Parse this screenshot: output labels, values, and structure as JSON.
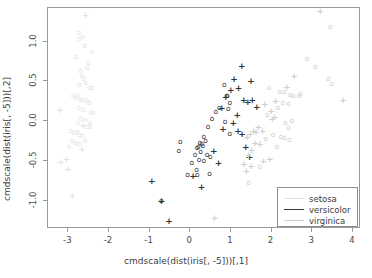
{
  "chart_data": {
    "type": "scatter",
    "title": "",
    "xlabel": "cmdscale(dist(iris[, -5]))[,1]",
    "ylabel": "cmdscale(dist(iris[, -5]))[,2]",
    "xlim": [
      -3.5,
      4.2
    ],
    "ylim": [
      -1.35,
      1.42
    ],
    "xticks": [
      -3,
      -2,
      -1,
      0,
      1,
      2,
      3,
      4
    ],
    "xticklabels": [
      "-3",
      "-2",
      "-1",
      "0",
      "1",
      "2",
      "3",
      "4"
    ],
    "yticks": [
      -1.0,
      -0.5,
      0.0,
      0.5,
      1.0
    ],
    "yticklabels": [
      "-1.0",
      "-0.5",
      "0.0",
      "0.5",
      "1.0"
    ],
    "grid": false,
    "legend_position": "bottom-right",
    "legend": [
      {
        "label": "setosa",
        "color": "#e2e2e2"
      },
      {
        "label": "versicolor",
        "color": "#3a3a3a"
      },
      {
        "label": "virginica",
        "color": "#cdcdcd"
      }
    ],
    "series": [
      {
        "name": "setosa",
        "color": "#e4e4e4",
        "points": [
          {
            "x": -2.55,
            "y": 1.32,
            "m": "+"
          },
          {
            "x": -2.72,
            "y": 1.1,
            "m": "o"
          },
          {
            "x": -2.7,
            "y": 1.02,
            "m": "o"
          },
          {
            "x": -2.62,
            "y": 1.05,
            "m": "o"
          },
          {
            "x": -2.57,
            "y": 0.93,
            "m": "o"
          },
          {
            "x": -2.78,
            "y": 0.79,
            "m": "o"
          },
          {
            "x": -2.4,
            "y": 0.86,
            "m": "o"
          },
          {
            "x": -2.48,
            "y": 0.72,
            "m": "o"
          },
          {
            "x": -2.68,
            "y": 0.62,
            "m": "o"
          },
          {
            "x": -2.64,
            "y": 0.56,
            "m": "o"
          },
          {
            "x": -2.6,
            "y": 0.52,
            "m": "o"
          },
          {
            "x": -2.55,
            "y": 0.47,
            "m": "o"
          },
          {
            "x": -2.7,
            "y": 0.44,
            "m": "o"
          },
          {
            "x": -2.46,
            "y": 0.4,
            "m": "o"
          },
          {
            "x": -2.39,
            "y": 0.4,
            "m": "o"
          },
          {
            "x": -2.86,
            "y": 0.3,
            "m": "o"
          },
          {
            "x": -2.8,
            "y": 0.28,
            "m": "o"
          },
          {
            "x": -2.74,
            "y": 0.31,
            "m": "o"
          },
          {
            "x": -2.69,
            "y": 0.26,
            "m": "o"
          },
          {
            "x": -2.62,
            "y": 0.25,
            "m": "o"
          },
          {
            "x": -2.52,
            "y": 0.24,
            "m": "o"
          },
          {
            "x": -2.46,
            "y": 0.22,
            "m": "o"
          },
          {
            "x": -3.18,
            "y": 0.13,
            "m": "+"
          },
          {
            "x": -2.72,
            "y": 0.16,
            "m": "o"
          },
          {
            "x": -2.6,
            "y": 0.13,
            "m": "o"
          },
          {
            "x": -2.42,
            "y": 0.1,
            "m": "o"
          },
          {
            "x": -2.36,
            "y": 0.09,
            "m": "o"
          },
          {
            "x": -2.66,
            "y": 0.02,
            "m": "o"
          },
          {
            "x": -2.56,
            "y": 0.0,
            "m": "o"
          },
          {
            "x": -2.74,
            "y": -0.04,
            "m": "o"
          },
          {
            "x": -2.62,
            "y": -0.06,
            "m": "+"
          },
          {
            "x": -2.52,
            "y": -0.09,
            "m": "o"
          },
          {
            "x": -2.44,
            "y": -0.09,
            "m": "o"
          },
          {
            "x": -2.92,
            "y": -0.13,
            "m": "o"
          },
          {
            "x": -2.84,
            "y": -0.16,
            "m": "o"
          },
          {
            "x": -2.76,
            "y": -0.15,
            "m": "o"
          },
          {
            "x": -2.7,
            "y": -0.18,
            "m": "o"
          },
          {
            "x": -2.62,
            "y": -0.2,
            "m": "o"
          },
          {
            "x": -2.88,
            "y": -0.26,
            "m": "o"
          },
          {
            "x": -2.8,
            "y": -0.28,
            "m": "o"
          },
          {
            "x": -2.72,
            "y": -0.3,
            "m": "o"
          },
          {
            "x": -2.56,
            "y": -0.26,
            "m": "o"
          },
          {
            "x": -2.96,
            "y": -0.34,
            "m": "o"
          },
          {
            "x": -2.64,
            "y": -0.36,
            "m": "+"
          },
          {
            "x": -3.02,
            "y": -0.49,
            "m": "+"
          },
          {
            "x": -3.16,
            "y": -0.52,
            "m": "+"
          },
          {
            "x": -2.98,
            "y": -0.61,
            "m": "+"
          },
          {
            "x": -2.88,
            "y": -0.95,
            "m": "+"
          },
          {
            "x": -2.5,
            "y": 0.66,
            "m": "o"
          },
          {
            "x": -2.44,
            "y": -0.04,
            "m": "o"
          }
        ]
      },
      {
        "name": "versicolor",
        "color": "#333333",
        "points": [
          {
            "x": 1.29,
            "y": 0.68,
            "m": "+"
          },
          {
            "x": 1.1,
            "y": 0.52,
            "m": "+"
          },
          {
            "x": 1.52,
            "y": 0.49,
            "m": "+"
          },
          {
            "x": 0.86,
            "y": 0.44,
            "m": "o"
          },
          {
            "x": 1.21,
            "y": 0.4,
            "m": "+"
          },
          {
            "x": 1.02,
            "y": 0.38,
            "m": "+"
          },
          {
            "x": 0.92,
            "y": 0.3,
            "m": "o"
          },
          {
            "x": 0.94,
            "y": 0.31,
            "m": "o"
          },
          {
            "x": 0.9,
            "y": 0.29,
            "m": "+"
          },
          {
            "x": 1.34,
            "y": 0.25,
            "m": "+"
          },
          {
            "x": 1.55,
            "y": 0.26,
            "m": "+"
          },
          {
            "x": 1.0,
            "y": 0.22,
            "m": "o"
          },
          {
            "x": 1.44,
            "y": 0.23,
            "m": "+"
          },
          {
            "x": 0.74,
            "y": 0.16,
            "m": "o"
          },
          {
            "x": 0.8,
            "y": 0.15,
            "m": "+"
          },
          {
            "x": 0.96,
            "y": 0.14,
            "m": "o"
          },
          {
            "x": 1.66,
            "y": 0.17,
            "m": "+"
          },
          {
            "x": 0.65,
            "y": 0.11,
            "m": "o"
          },
          {
            "x": 1.18,
            "y": 0.07,
            "m": "+"
          },
          {
            "x": 0.56,
            "y": 0.02,
            "m": "o"
          },
          {
            "x": 0.88,
            "y": -0.02,
            "m": "o"
          },
          {
            "x": 1.08,
            "y": -0.03,
            "m": "+"
          },
          {
            "x": 0.46,
            "y": -0.08,
            "m": "o"
          },
          {
            "x": 0.83,
            "y": -0.11,
            "m": "+"
          },
          {
            "x": 1.2,
            "y": -0.14,
            "m": "+"
          },
          {
            "x": 1.0,
            "y": -0.17,
            "m": "o"
          },
          {
            "x": 1.3,
            "y": -0.17,
            "m": "+"
          },
          {
            "x": 0.36,
            "y": -0.21,
            "m": "o"
          },
          {
            "x": 0.4,
            "y": -0.26,
            "m": "o"
          },
          {
            "x": -0.22,
            "y": -0.27,
            "m": "o"
          },
          {
            "x": 0.26,
            "y": -0.28,
            "m": "o"
          },
          {
            "x": 0.3,
            "y": -0.3,
            "m": "o"
          },
          {
            "x": 0.33,
            "y": -0.32,
            "m": "o"
          },
          {
            "x": 0.22,
            "y": -0.33,
            "m": "o"
          },
          {
            "x": 1.39,
            "y": -0.34,
            "m": "+"
          },
          {
            "x": 0.19,
            "y": -0.35,
            "m": "o"
          },
          {
            "x": -0.26,
            "y": -0.38,
            "m": "o"
          },
          {
            "x": 0.28,
            "y": -0.4,
            "m": "o"
          },
          {
            "x": 0.6,
            "y": -0.38,
            "m": "+"
          },
          {
            "x": 0.14,
            "y": -0.43,
            "m": "o"
          },
          {
            "x": 0.44,
            "y": -0.44,
            "m": "o"
          },
          {
            "x": 0.52,
            "y": -0.46,
            "m": "o"
          },
          {
            "x": 1.48,
            "y": -0.46,
            "m": "+"
          },
          {
            "x": 0.24,
            "y": -0.5,
            "m": "o"
          },
          {
            "x": 0.36,
            "y": -0.51,
            "m": "o"
          },
          {
            "x": 0.06,
            "y": -0.53,
            "m": "o"
          },
          {
            "x": 0.72,
            "y": -0.54,
            "m": "+"
          },
          {
            "x": 0.18,
            "y": -0.62,
            "m": "o"
          },
          {
            "x": -0.04,
            "y": -0.68,
            "m": "o"
          },
          {
            "x": 0.09,
            "y": -0.7,
            "m": "+"
          },
          {
            "x": 0.2,
            "y": -0.69,
            "m": "o"
          },
          {
            "x": 0.5,
            "y": -0.67,
            "m": "o"
          },
          {
            "x": -0.92,
            "y": -0.76,
            "m": "+"
          },
          {
            "x": 0.3,
            "y": -0.83,
            "m": "+"
          },
          {
            "x": -0.69,
            "y": -1.01,
            "m": "o"
          },
          {
            "x": -0.68,
            "y": -1.01,
            "m": "+"
          },
          {
            "x": -0.5,
            "y": -1.26,
            "m": "+"
          }
        ]
      },
      {
        "name": "virginica",
        "color": "#cfcfcf",
        "points": [
          {
            "x": 3.22,
            "y": 1.37,
            "m": "+"
          },
          {
            "x": 3.47,
            "y": 1.17,
            "m": "o"
          },
          {
            "x": 2.9,
            "y": 0.77,
            "m": "o"
          },
          {
            "x": 3.1,
            "y": 0.67,
            "m": "o"
          },
          {
            "x": 2.58,
            "y": 0.55,
            "m": "+"
          },
          {
            "x": 3.42,
            "y": 0.52,
            "m": "o"
          },
          {
            "x": 3.5,
            "y": 0.45,
            "m": "o"
          },
          {
            "x": 2.4,
            "y": 0.42,
            "m": "+"
          },
          {
            "x": 1.96,
            "y": 0.4,
            "m": "o"
          },
          {
            "x": 2.22,
            "y": 0.36,
            "m": "o"
          },
          {
            "x": 2.34,
            "y": 0.35,
            "m": "o"
          },
          {
            "x": 2.48,
            "y": 0.32,
            "m": "o"
          },
          {
            "x": 2.56,
            "y": 0.3,
            "m": "o"
          },
          {
            "x": 2.7,
            "y": 0.31,
            "m": "o"
          },
          {
            "x": 2.74,
            "y": 0.33,
            "m": "o"
          },
          {
            "x": 3.78,
            "y": 0.26,
            "m": "+"
          },
          {
            "x": 2.12,
            "y": 0.24,
            "m": "+"
          },
          {
            "x": 2.3,
            "y": 0.22,
            "m": "o"
          },
          {
            "x": 2.44,
            "y": 0.2,
            "m": "o"
          },
          {
            "x": 1.86,
            "y": 0.21,
            "m": "+"
          },
          {
            "x": 2.18,
            "y": 0.16,
            "m": "o"
          },
          {
            "x": 2.02,
            "y": 0.12,
            "m": "+"
          },
          {
            "x": 1.92,
            "y": 0.07,
            "m": "o"
          },
          {
            "x": 2.1,
            "y": 0.04,
            "m": "+"
          },
          {
            "x": 2.04,
            "y": 0.02,
            "m": "+"
          },
          {
            "x": 2.52,
            "y": -0.01,
            "m": "o"
          },
          {
            "x": 2.36,
            "y": -0.03,
            "m": "o"
          },
          {
            "x": 1.7,
            "y": -0.09,
            "m": "+"
          },
          {
            "x": 2.44,
            "y": -0.1,
            "m": "o"
          },
          {
            "x": 1.58,
            "y": -0.13,
            "m": "+"
          },
          {
            "x": 1.64,
            "y": -0.15,
            "m": "+"
          },
          {
            "x": 1.8,
            "y": -0.14,
            "m": "+"
          },
          {
            "x": 2.06,
            "y": -0.18,
            "m": "o"
          },
          {
            "x": 1.5,
            "y": -0.17,
            "m": "+"
          },
          {
            "x": 2.26,
            "y": -0.21,
            "m": "o"
          },
          {
            "x": 2.34,
            "y": -0.22,
            "m": "o"
          },
          {
            "x": 2.46,
            "y": -0.25,
            "m": "o"
          },
          {
            "x": 1.42,
            "y": -0.21,
            "m": "+"
          },
          {
            "x": 1.88,
            "y": -0.24,
            "m": "o"
          },
          {
            "x": 1.62,
            "y": -0.28,
            "m": "+"
          },
          {
            "x": 1.74,
            "y": -0.3,
            "m": "+"
          },
          {
            "x": 2.16,
            "y": -0.33,
            "m": "o"
          },
          {
            "x": 1.54,
            "y": -0.37,
            "m": "+"
          },
          {
            "x": 1.46,
            "y": -0.43,
            "m": "+"
          },
          {
            "x": 1.98,
            "y": -0.48,
            "m": "+"
          },
          {
            "x": 1.82,
            "y": -0.51,
            "m": "+"
          },
          {
            "x": 1.34,
            "y": -0.55,
            "m": "+"
          },
          {
            "x": 1.52,
            "y": -0.57,
            "m": "+"
          },
          {
            "x": 1.74,
            "y": -0.58,
            "m": "o"
          },
          {
            "x": 1.4,
            "y": -0.63,
            "m": "+"
          },
          {
            "x": 1.46,
            "y": -0.79,
            "m": "o"
          },
          {
            "x": 0.62,
            "y": -1.23,
            "m": "+"
          }
        ]
      }
    ]
  }
}
